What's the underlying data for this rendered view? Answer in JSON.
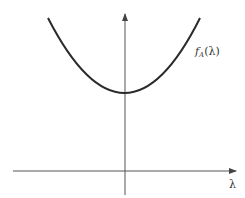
{
  "figure": {
    "curve_label": {
      "f": "f",
      "sub": "A",
      "arg": "(λ)"
    },
    "x_axis_label": "λ"
  },
  "colors": {
    "curve": "#2a2a2a",
    "axis": "#555555",
    "background": "#ffffff"
  }
}
